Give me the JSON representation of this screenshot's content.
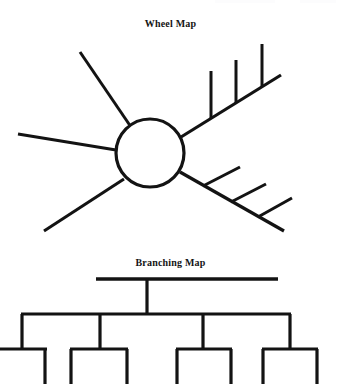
{
  "page": {
    "width": 341,
    "height": 386,
    "background_color": "#ffffff",
    "ink_color": "#131313"
  },
  "wheel_map": {
    "title": "Wheel Map",
    "title_position": {
      "x": 170,
      "y": 22
    },
    "circle": {
      "cx": 150,
      "cy": 153,
      "r": 34,
      "stroke_width": 3.2
    },
    "spokes": [
      {
        "name": "spoke-upper-left",
        "x1": 131,
        "y1": 127,
        "x2": 80,
        "y2": 52,
        "stroke_width": 3.0,
        "ticks": []
      },
      {
        "name": "spoke-left",
        "x1": 116,
        "y1": 150,
        "x2": 18,
        "y2": 134,
        "stroke_width": 3.0,
        "ticks": []
      },
      {
        "name": "spoke-lower-left",
        "x1": 124,
        "y1": 179,
        "x2": 44,
        "y2": 231,
        "stroke_width": 3.0,
        "ticks": []
      },
      {
        "name": "spoke-upper-right",
        "x1": 181,
        "y1": 137,
        "x2": 281,
        "y2": 75,
        "stroke_width": 3.2,
        "ticks": [
          {
            "name": "tick-1",
            "x1": 211,
            "y1": 118,
            "x2": 211,
            "y2": 71
          },
          {
            "name": "tick-2",
            "x1": 236,
            "y1": 103,
            "x2": 236,
            "y2": 60
          },
          {
            "name": "tick-3",
            "x1": 262,
            "y1": 87,
            "x2": 262,
            "y2": 44
          }
        ]
      },
      {
        "name": "spoke-lower-right",
        "x1": 180,
        "y1": 172,
        "x2": 284,
        "y2": 231,
        "stroke_width": 3.2,
        "ticks": [
          {
            "name": "tick-1",
            "x1": 203,
            "y1": 186,
            "x2": 240,
            "y2": 167
          },
          {
            "name": "tick-2",
            "x1": 231,
            "y1": 202,
            "x2": 266,
            "y2": 184
          },
          {
            "name": "tick-3",
            "x1": 258,
            "y1": 217,
            "x2": 292,
            "y2": 198
          }
        ]
      }
    ]
  },
  "branching_map": {
    "title": "Branching Map",
    "title_position": {
      "x": 152,
      "y": 261
    },
    "root_bar": {
      "x1": 96,
      "y1": 279,
      "x2": 278,
      "y2": 279,
      "stroke_width": 3.2
    },
    "trunk": {
      "x1": 147,
      "y1": 279,
      "x2": 147,
      "y2": 314,
      "stroke_width": 3.2
    },
    "level2_bar": {
      "x1": 21,
      "y1": 314,
      "x2": 291,
      "y2": 314,
      "stroke_width": 3.2
    },
    "level2_stems": [
      {
        "name": "stem-1",
        "x": 22,
        "y1": 314,
        "y2": 349
      },
      {
        "name": "stem-2",
        "x": 100,
        "y1": 314,
        "y2": 349
      },
      {
        "name": "stem-3",
        "x": 203,
        "y1": 314,
        "y2": 349
      },
      {
        "name": "stem-4",
        "x": 290,
        "y1": 314,
        "y2": 349
      }
    ],
    "leaf_groups": [
      {
        "name": "leaf-group-1",
        "bar_x1": 0,
        "bar_x2": 47,
        "bar_y": 349,
        "legs": [
          {
            "name": "leg-right",
            "x": 45,
            "y1": 349,
            "y2": 383
          }
        ]
      },
      {
        "name": "leaf-group-2",
        "bar_x1": 70,
        "bar_x2": 128,
        "bar_y": 349,
        "legs": [
          {
            "name": "leg-left",
            "x": 71,
            "y1": 349,
            "y2": 383
          },
          {
            "name": "leg-right",
            "x": 127,
            "y1": 349,
            "y2": 383
          }
        ]
      },
      {
        "name": "leaf-group-3",
        "bar_x1": 176,
        "bar_x2": 232,
        "bar_y": 349,
        "legs": [
          {
            "name": "leg-left",
            "x": 177,
            "y1": 349,
            "y2": 383
          },
          {
            "name": "leg-right",
            "x": 231,
            "y1": 349,
            "y2": 383
          }
        ]
      },
      {
        "name": "leaf-group-4",
        "bar_x1": 262,
        "bar_x2": 318,
        "bar_y": 349,
        "legs": [
          {
            "name": "leg-left",
            "x": 263,
            "y1": 349,
            "y2": 383
          },
          {
            "name": "leg-right",
            "x": 317,
            "y1": 349,
            "y2": 383
          }
        ]
      }
    ]
  }
}
